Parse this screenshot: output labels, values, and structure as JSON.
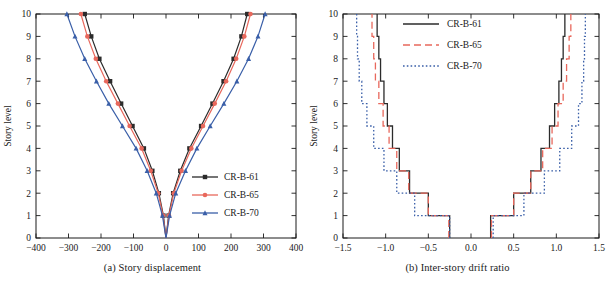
{
  "figure": {
    "panels": [
      {
        "id": "a",
        "caption": "(a) Story displacement"
      },
      {
        "id": "b",
        "caption": "(b) Inter-story drift ratio"
      }
    ]
  },
  "colors": {
    "series_61": "#2b2b2b",
    "series_65": "#e8685c",
    "series_70": "#3a5fa8",
    "axis": "#1a1a1a"
  },
  "chart_data": [
    {
      "type": "line",
      "panel": "a",
      "title": "(a) Story displacement",
      "xlabel": "Δ/mm",
      "ylabel": "Story level",
      "xlim": [
        -400,
        400
      ],
      "ylim": [
        0,
        10
      ],
      "xticks": [
        -400,
        -300,
        -200,
        -100,
        0,
        100,
        200,
        300,
        400
      ],
      "xticklabels": [
        "−400",
        "−300",
        "−200",
        "−100",
        "0",
        "100",
        "200",
        "300",
        "400"
      ],
      "yticks": [
        0,
        1,
        2,
        3,
        4,
        5,
        6,
        7,
        8,
        9,
        10
      ],
      "yticklabels": [
        "0",
        "1",
        "2",
        "3",
        "4",
        "5",
        "6",
        "7",
        "8",
        "9",
        "10"
      ],
      "grid": false,
      "legend_position": "lower-right",
      "y": [
        0,
        1,
        2,
        3,
        4,
        5,
        6,
        7,
        8,
        9,
        10
      ],
      "series": [
        {
          "name": "CR-B-61",
          "color": "#2b2b2b",
          "marker": "square",
          "linestyle": "solid",
          "x_negative": [
            0,
            -8,
            -22,
            -42,
            -68,
            -103,
            -138,
            -172,
            -205,
            -230,
            -250
          ],
          "x_positive": [
            0,
            8,
            22,
            44,
            72,
            108,
            143,
            177,
            208,
            232,
            250
          ]
        },
        {
          "name": "CR-B-65",
          "color": "#e8685c",
          "marker": "circle",
          "linestyle": "solid",
          "x_negative": [
            0,
            -9,
            -24,
            -47,
            -75,
            -112,
            -148,
            -184,
            -216,
            -242,
            -262
          ],
          "x_positive": [
            0,
            9,
            24,
            48,
            78,
            114,
            150,
            185,
            216,
            241,
            260
          ]
        },
        {
          "name": "CR-B-70",
          "color": "#3a5fa8",
          "marker": "triangle",
          "linestyle": "solid",
          "x_negative": [
            0,
            -11,
            -30,
            -58,
            -92,
            -134,
            -176,
            -214,
            -250,
            -280,
            -305
          ],
          "x_positive": [
            0,
            11,
            30,
            60,
            95,
            136,
            178,
            218,
            254,
            283,
            305
          ]
        }
      ]
    },
    {
      "type": "line",
      "panel": "b",
      "title": "(b) Inter-story drift ratio",
      "xlabel": "θ/%",
      "ylabel": "Story level",
      "xlim": [
        -1.5,
        1.5
      ],
      "ylim": [
        0,
        10
      ],
      "xticks": [
        -1.5,
        -1.0,
        -0.5,
        0.0,
        0.5,
        1.0,
        1.5
      ],
      "xticklabels": [
        "−1.5",
        "−1.0",
        "−0.5",
        "0.0",
        "0.5",
        "1.0",
        "1.5"
      ],
      "yticks": [
        0,
        1,
        2,
        3,
        4,
        5,
        6,
        7,
        8,
        9,
        10
      ],
      "yticklabels": [
        "0",
        "1",
        "2",
        "3",
        "4",
        "5",
        "6",
        "7",
        "8",
        "9",
        "10"
      ],
      "grid": false,
      "legend_position": "top-center",
      "drawstyle": "steps",
      "stories": [
        1,
        2,
        3,
        4,
        5,
        6,
        7,
        8,
        9,
        10
      ],
      "series": [
        {
          "name": "CR-B-61",
          "color": "#2b2b2b",
          "linestyle": "solid",
          "theta_negative": [
            -0.25,
            -0.5,
            -0.72,
            -0.84,
            -0.92,
            -0.98,
            -1.02,
            -1.06,
            -1.08,
            -1.1
          ],
          "theta_positive": [
            0.23,
            0.5,
            0.7,
            0.82,
            0.92,
            0.98,
            1.03,
            1.06,
            1.08,
            1.1
          ]
        },
        {
          "name": "CR-B-65",
          "color": "#e8685c",
          "linestyle": "dashed",
          "theta_negative": [
            -0.26,
            -0.5,
            -0.73,
            -0.87,
            -0.96,
            -1.03,
            -1.08,
            -1.12,
            -1.14,
            -1.16
          ],
          "theta_positive": [
            0.24,
            0.5,
            0.7,
            0.84,
            0.95,
            1.02,
            1.08,
            1.12,
            1.15,
            1.17
          ]
        },
        {
          "name": "CR-B-70",
          "color": "#3a5fa8",
          "linestyle": "dotted",
          "theta_negative": [
            -0.25,
            -0.66,
            -0.87,
            -1.02,
            -1.14,
            -1.22,
            -1.28,
            -1.31,
            -1.33,
            -1.34
          ],
          "theta_positive": [
            0.26,
            0.62,
            0.86,
            1.04,
            1.18,
            1.26,
            1.3,
            1.32,
            1.33,
            1.34
          ]
        }
      ]
    }
  ]
}
